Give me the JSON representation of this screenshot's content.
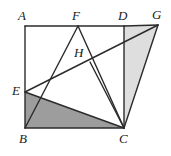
{
  "figure": {
    "width": 171,
    "height": 156,
    "background_color": "#ffffff",
    "stroke_color": "#2b2b2b",
    "stroke_width": 1.4,
    "shade_dark_color": "#9d9d9d",
    "shade_light_color": "#dedede"
  },
  "points": {
    "A": {
      "label": "A",
      "x": 25,
      "y": 26,
      "label_x": 18,
      "label_y": 9
    },
    "B": {
      "label": "B",
      "x": 25,
      "y": 128,
      "label_x": 19,
      "label_y": 132
    },
    "C": {
      "label": "C",
      "x": 124,
      "y": 128,
      "label_x": 119,
      "label_y": 132
    },
    "D": {
      "label": "D",
      "x": 124,
      "y": 26,
      "label_x": 118,
      "label_y": 9
    },
    "E": {
      "label": "E",
      "x": 25,
      "y": 92,
      "label_x": 12,
      "label_y": 84
    },
    "F": {
      "label": "F",
      "x": 78,
      "y": 26,
      "label_x": 72,
      "label_y": 9
    },
    "G": {
      "label": "G",
      "x": 158,
      "y": 25,
      "label_x": 152,
      "label_y": 8
    },
    "H": {
      "label": "H",
      "x": 90,
      "y": 62,
      "label_x": 74,
      "label_y": 46
    }
  },
  "shaded_regions": [
    {
      "name": "triangle-EBC",
      "vertices": "E,B,C",
      "polygon": "25,92 25,128 124,128",
      "fill": "#9d9d9d"
    },
    {
      "name": "triangle-DGC",
      "vertices": "D,G,C",
      "polygon": "124,26 158,25 124,128",
      "fill": "#dedede"
    }
  ],
  "segments": [
    {
      "name": "segment-AB",
      "from": "A",
      "to": "B",
      "x1": 25,
      "y1": 26,
      "x2": 25,
      "y2": 128
    },
    {
      "name": "segment-AD",
      "from": "A",
      "to": "D",
      "x1": 25,
      "y1": 26,
      "x2": 124,
      "y2": 26
    },
    {
      "name": "segment-DG",
      "from": "D",
      "to": "G",
      "x1": 124,
      "y1": 26,
      "x2": 158,
      "y2": 25
    },
    {
      "name": "segment-BC",
      "from": "B",
      "to": "C",
      "x1": 25,
      "y1": 128,
      "x2": 124,
      "y2": 128
    },
    {
      "name": "segment-DC",
      "from": "D",
      "to": "C",
      "x1": 124,
      "y1": 26,
      "x2": 124,
      "y2": 128
    },
    {
      "name": "segment-GC",
      "from": "G",
      "to": "C",
      "x1": 158,
      "y1": 25,
      "x2": 124,
      "y2": 128
    },
    {
      "name": "segment-EG",
      "from": "E",
      "to": "G",
      "x1": 25,
      "y1": 92,
      "x2": 158,
      "y2": 25
    },
    {
      "name": "segment-EC",
      "from": "E",
      "to": "C",
      "x1": 25,
      "y1": 92,
      "x2": 124,
      "y2": 128
    },
    {
      "name": "segment-BF",
      "from": "B",
      "to": "F",
      "x1": 25,
      "y1": 128,
      "x2": 78,
      "y2": 26
    },
    {
      "name": "segment-FC",
      "from": "F",
      "to": "C",
      "x1": 78,
      "y1": 26,
      "x2": 124,
      "y2": 128
    },
    {
      "name": "segment-HC",
      "from": "H",
      "to": "C",
      "x1": 90,
      "y1": 62,
      "x2": 124,
      "y2": 128
    }
  ]
}
